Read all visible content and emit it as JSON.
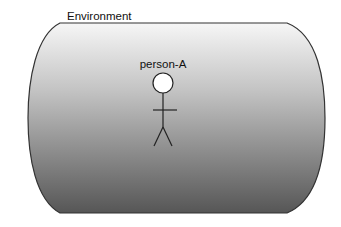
{
  "diagram": {
    "container": {
      "label": "Environment",
      "gradient_top": "#f4f4f4",
      "gradient_bottom": "#5a5a5a",
      "stroke": "#333333"
    },
    "actor": {
      "label": "person-A",
      "head_fill": "#ffffff",
      "stroke": "#222222"
    }
  }
}
